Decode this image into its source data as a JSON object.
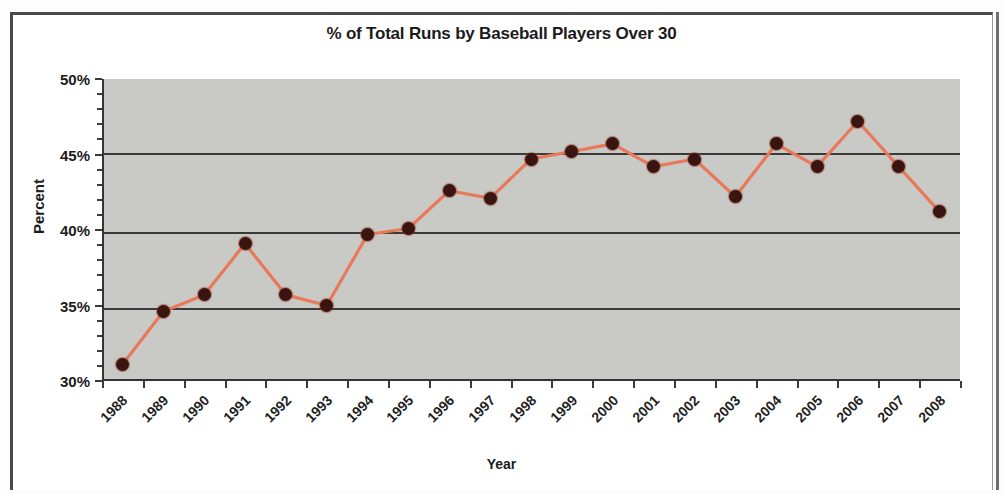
{
  "chart": {
    "title": "% of Total Runs by Baseball Players Over 30",
    "xlabel": "Year",
    "ylabel": "Percent"
  },
  "axis": {
    "y_ticks": [
      "50%",
      "45%",
      "40%",
      "35%",
      "30%"
    ]
  },
  "colors": {
    "plot_background": "#c9c9c5",
    "line": "#e8795a",
    "marker": "#3a1410",
    "gridline": "#3a3a3a",
    "text": "#1c1c1c"
  },
  "chart_data": {
    "type": "line",
    "title": "% of Total Runs by Baseball Players Over 30",
    "xlabel": "Year",
    "ylabel": "Percent",
    "ylim": [
      30,
      50
    ],
    "ytick_step": 5,
    "grid": true,
    "legend": "none",
    "categories": [
      "1988",
      "1989",
      "1990",
      "1991",
      "1992",
      "1993",
      "1994",
      "1995",
      "1996",
      "1997",
      "1998",
      "1999",
      "2000",
      "2001",
      "2002",
      "2003",
      "2004",
      "2005",
      "2006",
      "2007",
      "2008"
    ],
    "values": [
      31.1,
      34.6,
      35.7,
      39.1,
      35.7,
      35.0,
      39.7,
      40.1,
      42.6,
      42.1,
      44.7,
      45.2,
      45.7,
      44.2,
      44.7,
      42.2,
      45.7,
      44.2,
      47.2,
      44.2,
      41.2
    ],
    "units": "percent"
  }
}
